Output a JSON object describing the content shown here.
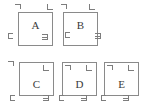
{
  "figure": {
    "background_color": "#ffffff",
    "border_color": "#8a8a8a",
    "mark_color": "#7d7d7d",
    "label_color": "#3a3a3a",
    "width": 148,
    "height": 110
  },
  "boxes": [
    {
      "id": "a",
      "label": "A",
      "x": 18,
      "y": 12,
      "w": 35,
      "h": 34,
      "label_top": 7,
      "marks": {
        "top_left": {
          "glyph": "corner-top-left",
          "dx": -3,
          "dy": -8
        },
        "top_right": {
          "glyph": "corner-top-right",
          "dx": 29,
          "dy": -8
        },
        "bottom_left": {
          "glyph": "corner-bottom-left",
          "dx": -10,
          "dy": 21
        },
        "bottom_right": {
          "glyph": "corner-bottom-right",
          "dx": 24,
          "dy": 22
        }
      }
    },
    {
      "id": "b",
      "label": "B",
      "x": 63,
      "y": 12,
      "w": 35,
      "h": 34,
      "label_top": 7,
      "marks": {
        "top_left": {
          "glyph": "corner-top-left",
          "dx": -2,
          "dy": -8
        },
        "top_right": {
          "glyph": "corner-top-right",
          "dx": 26,
          "dy": -8
        },
        "bottom_left": {
          "glyph": "corner-bottom-left",
          "dx": 2,
          "dy": 20
        },
        "bottom_right": {
          "glyph": "corner-bottom-right",
          "dx": 32,
          "dy": 21
        }
      }
    },
    {
      "id": "c",
      "label": "C",
      "x": 19,
      "y": 62,
      "w": 35,
      "h": 34,
      "label_top": 16,
      "marks": {
        "top_left": {
          "glyph": "corner-top-left",
          "dx": -11,
          "dy": -1
        },
        "top_right": {
          "glyph": "corner-top-right",
          "dx": 24,
          "dy": 3
        },
        "bottom_left": {
          "glyph": "corner-bottom-left",
          "dx": -9,
          "dy": 33
        },
        "bottom_right": {
          "glyph": "corner-bottom-right",
          "dx": 24,
          "dy": 33
        }
      }
    },
    {
      "id": "d",
      "label": "D",
      "x": 62,
      "y": 62,
      "w": 35,
      "h": 34,
      "label_top": 16,
      "marks": {
        "top_left": {
          "glyph": "corner-top-left",
          "dx": 3,
          "dy": 3
        },
        "top_right": {
          "glyph": "corner-top-right",
          "dx": 24,
          "dy": 3
        },
        "bottom_left": {
          "glyph": "corner-bottom-left",
          "dx": -3,
          "dy": 33
        },
        "bottom_right": {
          "glyph": "corner-bottom-right",
          "dx": 19,
          "dy": 33
        }
      }
    },
    {
      "id": "e",
      "label": "E",
      "x": 104,
      "y": 62,
      "w": 35,
      "h": 34,
      "label_top": 16,
      "marks": {
        "top_left": {
          "glyph": "corner-top-left",
          "dx": 3,
          "dy": 3
        },
        "top_right": {
          "glyph": "corner-top-right",
          "dx": 24,
          "dy": 3
        },
        "bottom_left": {
          "glyph": "corner-bottom-left",
          "dx": -3,
          "dy": 33
        },
        "bottom_right": {
          "glyph": "corner-bottom-right",
          "dx": 19,
          "dy": 33
        }
      }
    }
  ]
}
